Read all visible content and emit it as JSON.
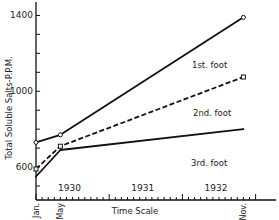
{
  "chart_data": {
    "type": "line",
    "title": "",
    "xlabel": "Time Scale",
    "ylabel": "Total Soluble Salts-P.P.M.",
    "ylim": [
      500,
      1450
    ],
    "yticks": [
      500,
      600,
      700,
      800,
      900,
      1000,
      1100,
      1200,
      1300,
      1400
    ],
    "ytick_labels": [
      {
        "value": 600,
        "label": "600"
      },
      {
        "value": 1000,
        "label": "1000"
      },
      {
        "value": 1400,
        "label": "1400"
      }
    ],
    "x_unit": "months since Jan 1930",
    "xlim": [
      0,
      36.5
    ],
    "year_labels": [
      {
        "at": 5.5,
        "label": "1930"
      },
      {
        "at": 17.5,
        "label": "1931"
      },
      {
        "at": 29.5,
        "label": "1932"
      }
    ],
    "month_labels": [
      {
        "at": 0,
        "label": "Jan."
      },
      {
        "at": 4,
        "label": "May"
      },
      {
        "at": 34,
        "label": "Nov."
      }
    ],
    "grid": false,
    "series": [
      {
        "name": "1st. foot",
        "style": "solid",
        "marker": "circle",
        "x": [
          0,
          4,
          34
        ],
        "values": [
          730,
          770,
          1390
        ]
      },
      {
        "name": "2nd. foot",
        "style": "dashed",
        "marker": "square",
        "x": [
          0,
          4,
          34
        ],
        "values": [
          590,
          710,
          1075
        ]
      },
      {
        "name": "3rd. foot",
        "style": "solid",
        "marker": "none",
        "x": [
          0,
          4,
          34
        ],
        "values": [
          550,
          690,
          800
        ]
      }
    ]
  }
}
